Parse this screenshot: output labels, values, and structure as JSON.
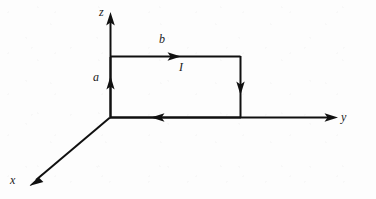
{
  "figure": {
    "type": "physics-diagram",
    "background_color": "#fdfdfd",
    "stroke_color": "#101010",
    "axes": [
      {
        "id": "x",
        "label": "x",
        "label_x": 10,
        "label_y": 175,
        "from": [
          110,
          117
        ],
        "to": [
          30,
          186
        ],
        "direction": "down-left"
      },
      {
        "id": "y",
        "label": "y",
        "label_x": 341,
        "label_y": 112,
        "from": [
          110,
          117
        ],
        "to": [
          338,
          117
        ],
        "direction": "right"
      },
      {
        "id": "z",
        "label": "z",
        "label_x": 99,
        "label_y": 6,
        "from": [
          110,
          117
        ],
        "to": [
          111,
          13
        ],
        "direction": "up"
      }
    ],
    "loop": {
      "origin": [
        110,
        117
      ],
      "top_y": 56,
      "right_x": 240,
      "left_x": 110,
      "bottom_y": 117,
      "current_direction": "counterclockwise-as-drawn",
      "segments": [
        {
          "name": "left-side-up",
          "from": [
            110,
            117
          ],
          "to": [
            110,
            56
          ],
          "arrow_at": [
            110,
            78
          ],
          "arrow_dir": "up"
        },
        {
          "name": "top-side-right",
          "from": [
            110,
            56
          ],
          "to": [
            240,
            56
          ],
          "arrow_at": [
            180,
            56
          ],
          "arrow_dir": "right"
        },
        {
          "name": "right-side-down",
          "from": [
            240,
            56
          ],
          "to": [
            240,
            117
          ],
          "arrow_at": [
            240,
            92
          ],
          "arrow_dir": "down"
        },
        {
          "name": "bottom-side-left",
          "from": [
            240,
            117
          ],
          "to": [
            110,
            117
          ],
          "arrow_at": [
            152,
            117
          ],
          "arrow_dir": "left"
        }
      ]
    },
    "labels": [
      {
        "id": "a",
        "text": "a",
        "x": 93,
        "y": 72,
        "meaning": "height of the loop along z"
      },
      {
        "id": "b",
        "text": "b",
        "x": 159,
        "y": 34,
        "meaning": "width of the loop along y"
      },
      {
        "id": "I",
        "text": "I",
        "x": 179,
        "y": 62,
        "meaning": "current in the loop"
      }
    ]
  }
}
